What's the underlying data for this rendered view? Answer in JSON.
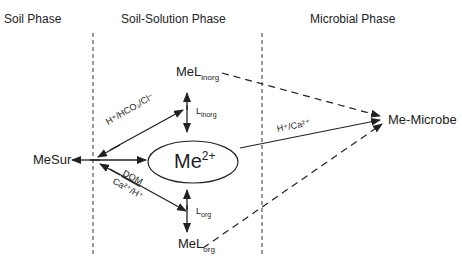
{
  "phases": {
    "soil": "Soil Phase",
    "solution": "Soil-Solution Phase",
    "microbial": "Microbial Phase"
  },
  "nodes": {
    "me_sur": "MeSur",
    "me_free": {
      "base": "Me",
      "sup": "2+"
    },
    "mel_inorg": {
      "base": "MeL",
      "sub": "inorg"
    },
    "mel_org": {
      "base": "MeL",
      "sub": "org"
    },
    "me_microbe": "Me-Microbe"
  },
  "edge_labels": {
    "inorg_exchange": "H⁺/HCO₃/Cl⁻",
    "l_inorg": {
      "base": "L",
      "sub": "inorg"
    },
    "dom": "DOM",
    "ca_h": "Ca²⁺/H⁺",
    "l_org": {
      "base": "L",
      "sub": "org"
    },
    "microbe_uptake": "H⁺/Ca²⁺"
  },
  "colors": {
    "line": "#222222",
    "background": "#ffffff"
  }
}
